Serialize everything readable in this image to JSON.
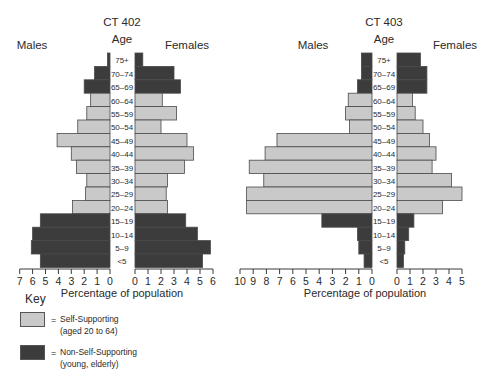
{
  "chart_data": [
    {
      "type": "bar",
      "subtype": "population-pyramid",
      "title": "CT 402",
      "center_label": "Age",
      "left_label": "Males",
      "right_label": "Females",
      "xlabel": "Percentage of population",
      "categories": [
        "75+",
        "70–74",
        "65–69",
        "60–64",
        "55–59",
        "50–54",
        "45–49",
        "40–44",
        "35–39",
        "30–34",
        "25–29",
        "20–24",
        "15–19",
        "10–14",
        "5–9",
        "<5"
      ],
      "series": [
        {
          "name": "Males",
          "values": [
            0.2,
            1.2,
            2.0,
            1.5,
            1.8,
            2.5,
            4.1,
            3.0,
            2.6,
            1.8,
            1.9,
            2.9,
            5.4,
            6.0,
            6.1,
            5.4
          ]
        },
        {
          "name": "Females",
          "values": [
            0.6,
            3.0,
            3.5,
            2.1,
            3.2,
            2.0,
            4.0,
            4.5,
            3.8,
            2.5,
            2.4,
            2.5,
            3.9,
            4.8,
            5.8,
            5.2
          ]
        }
      ],
      "category_group": [
        "non",
        "non",
        "non",
        "self",
        "self",
        "self",
        "self",
        "self",
        "self",
        "self",
        "self",
        "self",
        "non",
        "non",
        "non",
        "non"
      ],
      "left_axis": {
        "ticks": [
          "7",
          "6",
          "5",
          "4",
          "3",
          "2",
          "1",
          "0"
        ],
        "max": 7
      },
      "right_axis": {
        "ticks": [
          "0",
          "1",
          "2",
          "3",
          "4",
          "5",
          "6"
        ],
        "max": 6
      }
    },
    {
      "type": "bar",
      "subtype": "population-pyramid",
      "title": "CT 403",
      "center_label": "Age",
      "left_label": "Males",
      "right_label": "Females",
      "xlabel": "Percentage of population",
      "categories": [
        "75+",
        "70–74",
        "65–69",
        "60–64",
        "55–59",
        "50–54",
        "45–49",
        "40–44",
        "35–39",
        "30–34",
        "25–29",
        "20–24",
        "15–19",
        "10–14",
        "5–9",
        "<5"
      ],
      "series": [
        {
          "name": "Males",
          "values": [
            0.8,
            0.8,
            1.1,
            1.8,
            2.0,
            1.7,
            7.2,
            8.1,
            9.3,
            8.2,
            9.5,
            9.5,
            3.8,
            1.1,
            1.0,
            0.6
          ]
        },
        {
          "name": "Females",
          "values": [
            1.8,
            2.3,
            2.3,
            1.2,
            1.4,
            2.0,
            2.5,
            3.0,
            2.7,
            4.2,
            5.0,
            3.5,
            1.3,
            0.9,
            0.6,
            0.5
          ]
        }
      ],
      "category_group": [
        "non",
        "non",
        "non",
        "self",
        "self",
        "self",
        "self",
        "self",
        "self",
        "self",
        "self",
        "self",
        "non",
        "non",
        "non",
        "non"
      ],
      "left_axis": {
        "ticks": [
          "10",
          "9",
          "8",
          "7",
          "6",
          "5",
          "4",
          "3",
          "2",
          "1",
          "0"
        ],
        "max": 10
      },
      "right_axis": {
        "ticks": [
          "0",
          "1",
          "2",
          "3",
          "4",
          "5"
        ],
        "max": 5
      }
    }
  ],
  "colors": {
    "self": "#c9c9c9",
    "non": "#3c3c3c",
    "outline": "#4a4a4a",
    "axis": "#3a3a3a"
  },
  "key": {
    "title": "Key",
    "items": [
      {
        "group": "self",
        "eq": "=",
        "line1": "Self-Supporting",
        "line2": "(aged 20 to 64)"
      },
      {
        "group": "non",
        "eq": "=",
        "line1": "Non-Self-Supporting",
        "line2": "(young, elderly)"
      }
    ]
  }
}
